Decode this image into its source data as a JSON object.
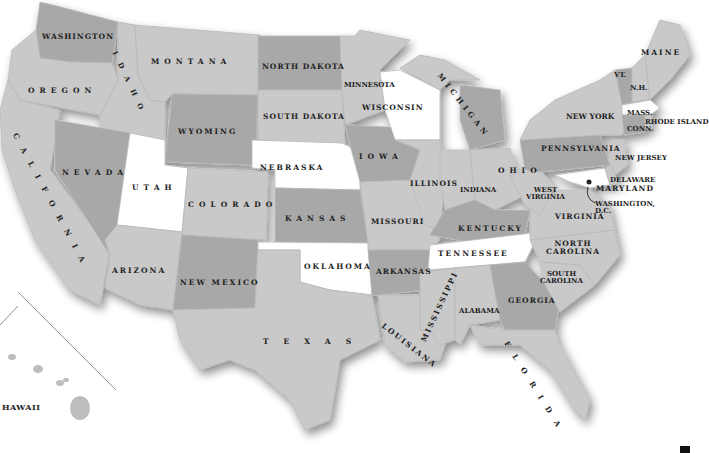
{
  "map": {
    "title": "United States map",
    "colors": {
      "light": "#c9c9c9",
      "mid": "#a8a8a8",
      "white": "#ffffff",
      "label": "#1e1e1e",
      "background": "#ffffff"
    },
    "states": [
      {
        "name": "WASHINGTON",
        "shade": "mid"
      },
      {
        "name": "OREGON",
        "shade": "light"
      },
      {
        "name": "CALIFORNIA",
        "shade": "light"
      },
      {
        "name": "IDAHO",
        "shade": "light"
      },
      {
        "name": "NEVADA",
        "shade": "mid"
      },
      {
        "name": "MONTANA",
        "shade": "light"
      },
      {
        "name": "WYOMING",
        "shade": "mid"
      },
      {
        "name": "UTAH",
        "shade": "white"
      },
      {
        "name": "ARIZONA",
        "shade": "light"
      },
      {
        "name": "COLORADO",
        "shade": "light"
      },
      {
        "name": "NEW MEXICO",
        "shade": "mid"
      },
      {
        "name": "NORTH DAKOTA",
        "shade": "mid"
      },
      {
        "name": "SOUTH DAKOTA",
        "shade": "light"
      },
      {
        "name": "NEBRASKA",
        "shade": "white"
      },
      {
        "name": "KANSAS",
        "shade": "mid"
      },
      {
        "name": "OKLAHOMA",
        "shade": "white"
      },
      {
        "name": "TEXAS",
        "shade": "light"
      },
      {
        "name": "MINNESOTA",
        "shade": "light"
      },
      {
        "name": "IOWA",
        "shade": "mid"
      },
      {
        "name": "MISSOURI",
        "shade": "light"
      },
      {
        "name": "ARKANSAS",
        "shade": "mid"
      },
      {
        "name": "LOUISIANA",
        "shade": "light"
      },
      {
        "name": "WISCONSIN",
        "shade": "white"
      },
      {
        "name": "ILLINOIS",
        "shade": "light"
      },
      {
        "name": "MICHIGAN",
        "shade": "mid"
      },
      {
        "name": "INDIANA",
        "shade": "light"
      },
      {
        "name": "OHIO",
        "shade": "light"
      },
      {
        "name": "KENTUCKY",
        "shade": "mid"
      },
      {
        "name": "TENNESSEE",
        "shade": "white"
      },
      {
        "name": "MISSISSIPPI",
        "shade": "light"
      },
      {
        "name": "ALABAMA",
        "shade": "light"
      },
      {
        "name": "GEORGIA",
        "shade": "mid"
      },
      {
        "name": "FLORIDA",
        "shade": "light"
      },
      {
        "name": "SOUTH CAROLINA",
        "shade": "light"
      },
      {
        "name": "NORTH CAROLINA",
        "shade": "light"
      },
      {
        "name": "VIRGINIA",
        "shade": "light"
      },
      {
        "name": "WEST VIRGINIA",
        "shade": "light"
      },
      {
        "name": "PENNSYLVANIA",
        "shade": "mid"
      },
      {
        "name": "NEW YORK",
        "shade": "light"
      },
      {
        "name": "NEW JERSEY",
        "shade": "light"
      },
      {
        "name": "DELAWARE",
        "shade": "light"
      },
      {
        "name": "MARYLAND",
        "shade": "white"
      },
      {
        "name": "WASHINGTON, D.C.",
        "shade": "marker"
      },
      {
        "name": "CONN.",
        "shade": "mid"
      },
      {
        "name": "RHODE ISLAND",
        "shade": "light"
      },
      {
        "name": "MASS.",
        "shade": "white"
      },
      {
        "name": "VT.",
        "shade": "mid"
      },
      {
        "name": "N.H.",
        "shade": "light"
      },
      {
        "name": "MAINE",
        "shade": "light"
      },
      {
        "name": "HAWAII",
        "shade": "light"
      }
    ],
    "labels": {
      "washington": "WASHINGTON",
      "oregon": "OREGON",
      "california": "CALIFORNIA",
      "idaho": "IDAHO",
      "nevada": "NEVADA",
      "montana": "MONTANA",
      "wyoming": "WYOMING",
      "utah": "UTAH",
      "arizona": "ARIZONA",
      "colorado": "COLORADO",
      "new_mexico": "NEW MEXICO",
      "north_dakota": "NORTH DAKOTA",
      "south_dakota": "SOUTH DAKOTA",
      "nebraska": "NEBRASKA",
      "kansas": "KANSAS",
      "oklahoma": "OKLAHOMA",
      "texas": "TEXAS",
      "minnesota": "MINNESOTA",
      "iowa": "IOWA",
      "missouri": "MISSOURI",
      "arkansas": "ARKANSAS",
      "louisiana": "LOUISIANA",
      "wisconsin": "WISCONSIN",
      "illinois": "ILLINOIS",
      "michigan": "MICHIGAN",
      "indiana": "INDIANA",
      "ohio": "OHIO",
      "kentucky": "KENTUCKY",
      "tennessee": "TENNESSEE",
      "mississippi": "MISSISSIPPI",
      "alabama": "ALABAMA",
      "georgia": "GEORGIA",
      "florida": "FLORIDA",
      "south_carolina_1": "SOUTH",
      "south_carolina_2": "CAROLINA",
      "north_carolina_1": "NORTH",
      "north_carolina_2": "CAROLINA",
      "virginia": "VIRGINIA",
      "west_virginia_1": "WEST",
      "west_virginia_2": "VIRGINIA",
      "pennsylvania": "PENNSYLVANIA",
      "new_york": "NEW YORK",
      "new_jersey": "NEW JERSEY",
      "delaware": "DELAWARE",
      "maryland": "MARYLAND",
      "dc_1": "WASHINGTON,",
      "dc_2": "D.C.",
      "conn": "CONN.",
      "rhode_island": "RHODE ISLAND",
      "mass": "MASS.",
      "vt": "VT.",
      "nh": "N.H.",
      "maine": "MAINE",
      "hawaii": "HAWAII"
    }
  }
}
